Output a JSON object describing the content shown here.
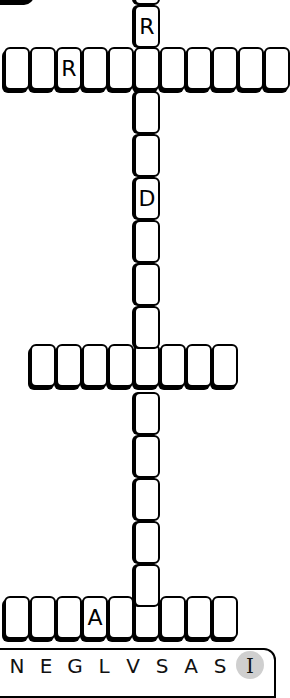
{
  "puzzle": {
    "vertical_word": {
      "x": 134,
      "tile_width": 26,
      "tile_height": 43,
      "start_y": -38,
      "cells": [
        "",
        "R",
        "",
        "",
        "",
        "D",
        "",
        "",
        "",
        "I",
        "",
        "",
        "",
        "",
        "",
        ""
      ]
    },
    "horizontal_words": [
      {
        "y": 47,
        "start_x": 4,
        "tile_width": 26,
        "tile_height": 43,
        "cells": [
          "",
          "",
          "R",
          "",
          "",
          "",
          "",
          "",
          "",
          "",
          ""
        ]
      },
      {
        "y": 344,
        "start_x": 30,
        "tile_width": 26,
        "tile_height": 43,
        "cells": [
          "",
          "",
          "",
          "",
          "",
          "",
          "",
          ""
        ]
      },
      {
        "y": 596,
        "start_x": 4,
        "tile_width": 26,
        "tile_height": 43,
        "cells": [
          "",
          "",
          "",
          "A",
          "",
          "",
          "",
          "",
          ""
        ]
      }
    ]
  },
  "letter_tray": {
    "letters": [
      {
        "char": "N",
        "x": 6
      },
      {
        "char": "E",
        "x": 35
      },
      {
        "char": "G",
        "x": 64
      },
      {
        "char": "L",
        "x": 93
      },
      {
        "char": "V",
        "x": 122
      },
      {
        "char": "S",
        "x": 151
      },
      {
        "char": "A",
        "x": 180
      },
      {
        "char": "S",
        "x": 209
      },
      {
        "char": "I",
        "x": 236,
        "selected": true
      }
    ],
    "selected_color": "#cfcfcf"
  }
}
